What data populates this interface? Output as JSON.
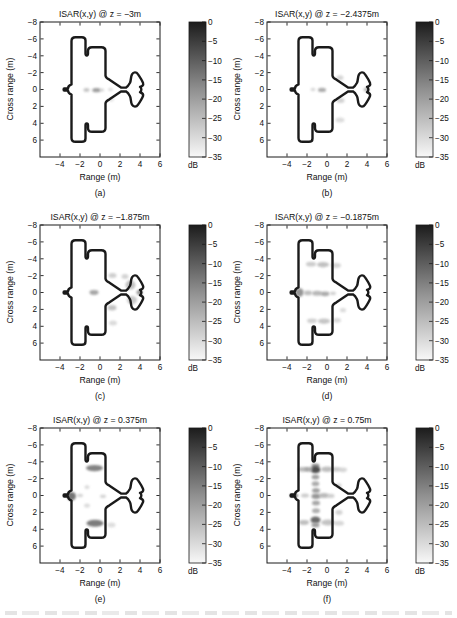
{
  "page": {
    "background": "#ffffff"
  },
  "chart_data": {
    "type": "heatmap",
    "layout": "3x2 grid of ISAR image slices, each with its own grayscale colorbar",
    "axes": {
      "xlabel": "Range (m)",
      "ylabel": "Cross range (m)",
      "xlim": [
        -6,
        6
      ],
      "ylim_top_to_bottom": [
        -8,
        8
      ],
      "xticks": [
        -4,
        -2,
        0,
        2,
        4,
        6
      ],
      "xtick_labels": [
        "−4",
        "−2",
        "0",
        "2",
        "4",
        "6"
      ],
      "yticks": [
        -8,
        -6,
        -4,
        -2,
        0,
        2,
        4,
        6
      ],
      "ytick_labels": [
        "−8",
        "−6",
        "−4",
        "−2",
        "0",
        "2",
        "4",
        "6"
      ],
      "grid": false
    },
    "colorbar": {
      "ticks": [
        0,
        -5,
        -10,
        -15,
        -20,
        -25,
        -30,
        -35
      ],
      "tick_labels": [
        "0",
        "−5",
        "−10",
        "−15",
        "−20",
        "−25",
        "−30",
        "−35"
      ],
      "unit": "dB",
      "top_color": "#1c1c1c",
      "mid_color": "#909090",
      "bottom_color": "#f8f8f8"
    },
    "outline_color": "#1a1a1a",
    "target_outline": [
      [
        "M",
        -2.85,
        -0.6
      ],
      [
        "C",
        -3.08,
        -0.5,
        -3.2,
        -0.3,
        -3.2,
        -0.13
      ],
      [
        "L",
        -3.58,
        -0.13
      ],
      [
        "C",
        -3.66,
        -0.13,
        -3.66,
        0.13,
        -3.58,
        0.13
      ],
      [
        "L",
        -3.2,
        0.13
      ],
      [
        "C",
        -3.2,
        0.3,
        -3.08,
        0.5,
        -2.85,
        0.6
      ],
      [
        "L",
        -2.85,
        5.75
      ],
      [
        "C",
        -2.85,
        6.05,
        -2.7,
        6.2,
        -2.45,
        6.2
      ],
      [
        "L",
        -1.82,
        6.2
      ],
      [
        "C",
        -1.57,
        6.2,
        -1.45,
        6.05,
        -1.45,
        5.8
      ],
      [
        "L",
        -1.45,
        4.25
      ],
      [
        "C",
        -1.45,
        3.96,
        -1.2,
        3.96,
        -1.2,
        4.25
      ],
      [
        "L",
        -1.2,
        4.55
      ],
      [
        "C",
        -1.2,
        4.85,
        -1.05,
        5.0,
        -0.8,
        5.0
      ],
      [
        "L",
        0.12,
        5.0
      ],
      [
        "C",
        0.38,
        5.0,
        0.55,
        4.85,
        0.55,
        4.55
      ],
      [
        "L",
        0.55,
        1.65
      ],
      [
        "C",
        0.57,
        1.4,
        0.72,
        1.28,
        0.95,
        1.16
      ],
      [
        "L",
        2.1,
        0.24
      ],
      [
        "L",
        2.6,
        0.22
      ],
      [
        "C",
        2.76,
        0.32,
        2.86,
        0.48,
        3.0,
        0.8
      ],
      [
        "C",
        3.12,
        1.1,
        3.06,
        1.5,
        3.2,
        1.8
      ],
      [
        "C",
        3.35,
        2.1,
        3.64,
        2.1,
        3.79,
        1.82
      ],
      [
        "C",
        3.99,
        1.48,
        4.2,
        1.1,
        4.3,
        0.78
      ],
      [
        "C",
        4.39,
        0.48,
        4.2,
        0.4,
        4.0,
        0.32
      ],
      [
        "C",
        4.18,
        0.18,
        4.18,
        -0.18,
        4.0,
        -0.32
      ],
      [
        "C",
        4.2,
        -0.4,
        4.39,
        -0.48,
        4.3,
        -0.78
      ],
      [
        "C",
        4.2,
        -1.1,
        3.99,
        -1.48,
        3.79,
        -1.82
      ],
      [
        "C",
        3.64,
        -2.1,
        3.35,
        -2.1,
        3.2,
        -1.8
      ],
      [
        "C",
        3.06,
        -1.5,
        3.12,
        -1.1,
        3.0,
        -0.8
      ],
      [
        "C",
        2.86,
        -0.48,
        2.76,
        -0.32,
        2.6,
        -0.22
      ],
      [
        "L",
        2.1,
        -0.24
      ],
      [
        "L",
        0.95,
        -1.16
      ],
      [
        "C",
        0.72,
        -1.28,
        0.57,
        -1.4,
        0.55,
        -1.65
      ],
      [
        "L",
        0.55,
        -4.55
      ],
      [
        "C",
        0.55,
        -4.85,
        0.38,
        -5.0,
        0.12,
        -5.0
      ],
      [
        "L",
        -0.8,
        -5.0
      ],
      [
        "C",
        -1.05,
        -5.0,
        -1.2,
        -4.85,
        -1.2,
        -4.55
      ],
      [
        "L",
        -1.2,
        -4.25
      ],
      [
        "C",
        -1.2,
        -3.96,
        -1.45,
        -3.96,
        -1.45,
        -4.25
      ],
      [
        "L",
        -1.45,
        -5.8
      ],
      [
        "C",
        -1.45,
        -6.05,
        -1.57,
        -6.2,
        -1.82,
        -6.2
      ],
      [
        "L",
        -2.45,
        -6.2
      ],
      [
        "C",
        -2.7,
        -6.2,
        -2.85,
        -6.05,
        -2.85,
        -5.75
      ],
      [
        "Z"
      ]
    ],
    "subplots": [
      {
        "letter": "(a)",
        "title": "ISAR(x,y) @ z = −3m",
        "scatter_blobs": [
          [
            -1.35,
            0.05,
            0.3,
            0.22,
            "#b5b5b5",
            0.8
          ],
          [
            -0.35,
            0.08,
            0.42,
            0.25,
            "#939393",
            0.9
          ],
          [
            0.2,
            0.05,
            0.22,
            0.18,
            "#c9c9c9",
            0.8
          ],
          [
            1.05,
            0.0,
            0.25,
            0.2,
            "#d6d6d6",
            0.8
          ],
          [
            1.1,
            1.2,
            0.3,
            0.25,
            "#dedede",
            0.8
          ]
        ]
      },
      {
        "letter": "(b)",
        "title": "ISAR(x,y) @ z = −2.4375m",
        "scatter_blobs": [
          [
            -0.5,
            0.05,
            0.4,
            0.26,
            "#a3a3a3",
            0.9
          ],
          [
            -1.4,
            0.0,
            0.25,
            0.2,
            "#cfcfcf",
            0.8
          ],
          [
            1.3,
            -1.4,
            0.35,
            0.3,
            "#cccccc",
            0.8
          ],
          [
            1.35,
            1.3,
            0.4,
            0.3,
            "#c6c6c6",
            0.8
          ],
          [
            1.3,
            3.6,
            0.45,
            0.3,
            "#d4d4d4",
            0.8
          ],
          [
            3.95,
            0.0,
            0.28,
            0.25,
            "#ababab",
            0.9
          ]
        ]
      },
      {
        "letter": "(c)",
        "title": "ISAR(x,y) @ z = −1.875m",
        "scatter_blobs": [
          [
            -0.6,
            0.0,
            0.45,
            0.28,
            "#9b9b9b",
            0.9
          ],
          [
            1.25,
            -2.0,
            0.4,
            0.3,
            "#c2c2c2",
            0.8
          ],
          [
            1.2,
            1.8,
            0.45,
            0.32,
            "#b8b8b8",
            0.85
          ],
          [
            3.05,
            -0.9,
            0.5,
            0.55,
            "#b2b2b2",
            0.8
          ],
          [
            3.2,
            0.9,
            0.5,
            0.5,
            "#bcbcbc",
            0.8
          ],
          [
            3.95,
            0.0,
            0.3,
            0.28,
            "#8f8f8f",
            0.9
          ],
          [
            1.3,
            3.6,
            0.4,
            0.3,
            "#d2d2d2",
            0.8
          ],
          [
            2.5,
            -1.9,
            0.35,
            0.3,
            "#c8c8c8",
            0.8
          ]
        ]
      },
      {
        "letter": "(d)",
        "title": "ISAR(x,y) @ z = −0.1875m",
        "scatter_blobs": [
          [
            -2.75,
            0.0,
            0.42,
            0.5,
            "#8a8a8a",
            0.9
          ],
          [
            -1.9,
            0.05,
            0.4,
            0.28,
            "#b3b3b3",
            0.85
          ],
          [
            -1.0,
            0.1,
            0.5,
            0.3,
            "#ababab",
            0.85
          ],
          [
            -0.2,
            0.15,
            0.45,
            0.28,
            "#a2a2a2",
            0.9
          ],
          [
            0.6,
            0.1,
            0.3,
            0.22,
            "#c6c6c6",
            0.8
          ],
          [
            -1.6,
            -3.35,
            0.5,
            0.28,
            "#c0c0c0",
            0.8
          ],
          [
            -0.4,
            -3.3,
            0.6,
            0.32,
            "#b6b6b6",
            0.85
          ],
          [
            0.9,
            -3.2,
            0.5,
            0.28,
            "#cacaca",
            0.8
          ],
          [
            -1.5,
            3.35,
            0.5,
            0.28,
            "#c4c4c4",
            0.8
          ],
          [
            -0.3,
            3.4,
            0.6,
            0.32,
            "#bbbbbb",
            0.85
          ],
          [
            1.0,
            3.3,
            0.4,
            0.28,
            "#d0d0d0",
            0.8
          ],
          [
            1.6,
            2.1,
            0.3,
            0.25,
            "#d2d2d2",
            0.8
          ]
        ]
      },
      {
        "letter": "(e)",
        "title": "ISAR(x,y) @ z = 0.375m",
        "scatter_blobs": [
          [
            -2.85,
            0.1,
            0.45,
            0.5,
            "#6e6e6e",
            0.95
          ],
          [
            -0.55,
            -3.25,
            0.85,
            0.38,
            "#7d7d7d",
            0.95
          ],
          [
            -0.5,
            3.3,
            0.85,
            0.42,
            "#757575",
            0.95
          ],
          [
            -1.3,
            -1.0,
            0.25,
            0.22,
            "#d0d0d0",
            0.8
          ],
          [
            -1.3,
            1.2,
            0.3,
            0.25,
            "#d3d3d3",
            0.8
          ],
          [
            0.3,
            0.1,
            0.3,
            0.22,
            "#cacaca",
            0.8
          ],
          [
            1.15,
            3.5,
            0.4,
            0.3,
            "#d6d6d6",
            0.8
          ],
          [
            -2.0,
            0.0,
            0.3,
            0.2,
            "#c8c8c8",
            0.8
          ]
        ]
      },
      {
        "letter": "(f)",
        "title": "ISAR(x,y) @ z = 0.75m",
        "scatter_blobs": [
          [
            -3.3,
            0.0,
            0.4,
            0.18,
            "#4f4f4f",
            1
          ],
          [
            -1.15,
            -3.5,
            0.4,
            0.28,
            "#8a8a8a",
            0.9
          ],
          [
            -1.15,
            -3.05,
            0.5,
            0.42,
            "#474747",
            0.95
          ],
          [
            -1.15,
            -2.2,
            0.38,
            0.3,
            "#989898",
            0.9
          ],
          [
            -1.15,
            -1.4,
            0.38,
            0.3,
            "#a3a3a3",
            0.9
          ],
          [
            -1.1,
            -0.6,
            0.4,
            0.3,
            "#989898",
            0.9
          ],
          [
            -1.1,
            0.1,
            0.45,
            0.32,
            "#8d8d8d",
            0.9
          ],
          [
            -1.1,
            0.9,
            0.4,
            0.3,
            "#9e9e9e",
            0.9
          ],
          [
            -1.1,
            1.8,
            0.4,
            0.3,
            "#a6a6a6",
            0.9
          ],
          [
            -1.15,
            2.9,
            0.5,
            0.4,
            "#646464",
            0.95
          ],
          [
            -1.15,
            3.5,
            0.4,
            0.3,
            "#969696",
            0.9
          ],
          [
            -2.4,
            -3.1,
            0.5,
            0.28,
            "#aeaeae",
            0.85
          ],
          [
            -1.85,
            -3.1,
            0.4,
            0.28,
            "#9e9e9e",
            0.85
          ],
          [
            0.0,
            -3.1,
            0.6,
            0.33,
            "#b3b3b3",
            0.85
          ],
          [
            0.9,
            -3.1,
            0.5,
            0.28,
            "#c0c0c0",
            0.8
          ],
          [
            1.6,
            -3.05,
            0.4,
            0.28,
            "#cccccc",
            0.8
          ],
          [
            -2.3,
            3.2,
            0.5,
            0.28,
            "#b3b3b3",
            0.85
          ],
          [
            0.1,
            3.2,
            0.7,
            0.35,
            "#b9b9b9",
            0.85
          ],
          [
            1.2,
            3.3,
            0.5,
            0.3,
            "#cecece",
            0.8
          ],
          [
            -2.2,
            0.0,
            0.4,
            0.25,
            "#c0c0c0",
            0.8
          ],
          [
            -0.3,
            0.0,
            0.5,
            0.3,
            "#aeaeae",
            0.85
          ],
          [
            0.4,
            0.05,
            0.35,
            0.25,
            "#c4c4c4",
            0.8
          ],
          [
            1.15,
            -1.2,
            0.3,
            0.25,
            "#cccccc",
            0.8
          ],
          [
            1.2,
            2.0,
            0.35,
            0.28,
            "#c8c8c8",
            0.8
          ]
        ]
      }
    ]
  }
}
